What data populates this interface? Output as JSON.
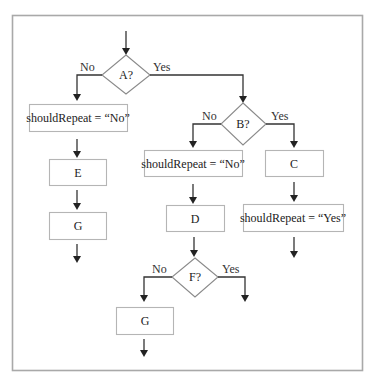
{
  "diagram": {
    "type": "flowchart",
    "decisions": {
      "a": {
        "label": "A?",
        "no": "No",
        "yes": "Yes"
      },
      "b": {
        "label": "B?",
        "no": "No",
        "yes": "Yes"
      },
      "f": {
        "label": "F?",
        "no": "No",
        "yes": "Yes"
      }
    },
    "boxes": {
      "a_no_set": "shouldRepeat = “No”",
      "e": "E",
      "g_left": "G",
      "b_no_set": "shouldRepeat = “No”",
      "c": "C",
      "d": "D",
      "b_yes_set": "shouldRepeat = “Yes”",
      "g_bottom": "G"
    },
    "colors": {
      "frame": "#a9a9a9",
      "box_border": "#b5b5b5",
      "line": "#333333"
    }
  }
}
